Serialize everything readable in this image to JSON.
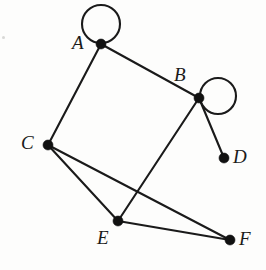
{
  "diagram": {
    "background_color": "#fdfdfc",
    "stroke_color": "#1a1a1a",
    "vertex_color": "#111111",
    "width": 266,
    "height": 270,
    "vertices": [
      {
        "id": "A",
        "label": "A",
        "x": 101,
        "y": 44,
        "label_x": 72,
        "label_y": 33,
        "has_self_loop": true
      },
      {
        "id": "B",
        "label": "B",
        "x": 199,
        "y": 98,
        "label_x": 174,
        "label_y": 65,
        "has_self_loop": true
      },
      {
        "id": "C",
        "label": "C",
        "x": 48,
        "y": 145,
        "label_x": 21,
        "label_y": 133,
        "has_self_loop": false
      },
      {
        "id": "D",
        "label": "D",
        "x": 224,
        "y": 158,
        "label_x": 233,
        "label_y": 147,
        "has_self_loop": false
      },
      {
        "id": "E",
        "label": "E",
        "x": 118,
        "y": 221,
        "label_x": 97,
        "label_y": 228,
        "has_self_loop": false
      },
      {
        "id": "F",
        "label": "F",
        "x": 230,
        "y": 240,
        "label_x": 239,
        "label_y": 229,
        "has_self_loop": false
      }
    ],
    "edges": [
      {
        "from": "A",
        "to": "B"
      },
      {
        "from": "A",
        "to": "C"
      },
      {
        "from": "B",
        "to": "D"
      },
      {
        "from": "B",
        "to": "E"
      },
      {
        "from": "C",
        "to": "E"
      },
      {
        "from": "C",
        "to": "F"
      },
      {
        "from": "E",
        "to": "F"
      }
    ],
    "self_loops": [
      {
        "vertex": "A",
        "center_x": 101,
        "center_y": 24,
        "radius": 19
      },
      {
        "vertex": "B",
        "center_x": 218,
        "center_y": 96,
        "radius": 18
      }
    ],
    "vertex_radius": 5,
    "edge_stroke_width": 2.1,
    "artifacts": [
      {
        "x": 2,
        "y": 36,
        "size": 3
      }
    ]
  }
}
